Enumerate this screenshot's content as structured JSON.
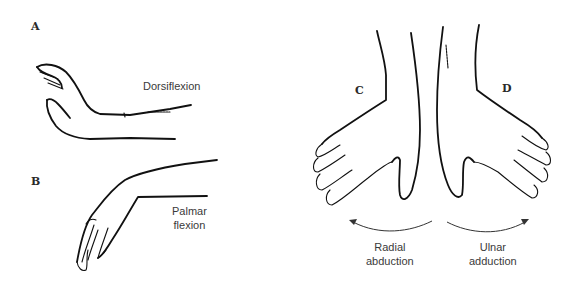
{
  "figure": {
    "panels": [
      {
        "id": "A",
        "letter": "A",
        "caption_lines": [
          "Dorsiflexion"
        ]
      },
      {
        "id": "B",
        "letter": "B",
        "caption_lines": [
          "Palmar",
          "flexion"
        ]
      },
      {
        "id": "C",
        "letter": "C",
        "caption_lines": [
          "Radial",
          "abduction"
        ]
      },
      {
        "id": "D",
        "letter": "D",
        "caption_lines": [
          "Ulnar",
          "adduction"
        ]
      }
    ],
    "signature": "H.Green",
    "colors": {
      "ink": "#111111",
      "text": "#3a3a3a",
      "background": "#ffffff"
    }
  }
}
